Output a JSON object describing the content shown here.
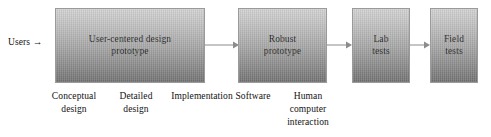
{
  "diagram": {
    "background_color": "#ffffff",
    "box_fill_light": "#d2d2d2",
    "box_fill_dark": "#717171",
    "arrow_color": "#8c8c8c",
    "text_color": "#111111",
    "entry_label": "Users",
    "entry_arrow_glyph": "→",
    "boxes": [
      {
        "id": "user-centered-design-prototype",
        "label": "User-centered design\nprototype"
      },
      {
        "id": "robust-prototype",
        "label": "Robust\nprototype"
      },
      {
        "id": "lab-tests",
        "label": "Lab\ntests"
      },
      {
        "id": "field-tests",
        "label": "Field\ntests"
      }
    ],
    "captions": [
      {
        "id": "conceptual-design",
        "label": "Conceptual\ndesign"
      },
      {
        "id": "detailed-design",
        "label": "Detailed\ndesign"
      },
      {
        "id": "implementation",
        "label": "Implementation"
      },
      {
        "id": "software",
        "label": "Software"
      },
      {
        "id": "human-computer-interaction",
        "label": "Human\ncomputer\ninteraction"
      }
    ],
    "arrows": [
      {
        "id": "arrow-prototype-to-robust"
      },
      {
        "id": "arrow-robust-to-lab"
      },
      {
        "id": "arrow-lab-to-field"
      }
    ]
  }
}
